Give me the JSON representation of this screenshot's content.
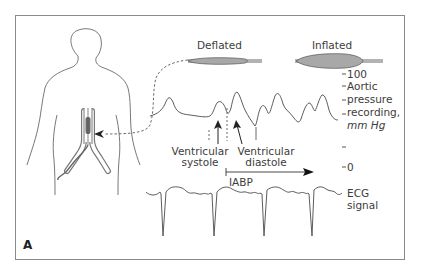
{
  "figure": {
    "panel_label": "A",
    "balloon": {
      "deflated_label": "Deflated",
      "inflated_label": "Inflated"
    },
    "pressure_axis": {
      "tick_top": "100",
      "tick_bottom": "0",
      "label_line1": "Aortic",
      "label_line2": "pressure",
      "label_line3": "recording,",
      "label_units": "mm Hg"
    },
    "annotations": {
      "systole_line1": "Ventricular",
      "systole_line2": "systole",
      "diastole_line1": "Ventricular",
      "diastole_line2": "diastole",
      "iabp": "IABP"
    },
    "ecg": {
      "label_line1": "ECG",
      "label_line2": "signal"
    },
    "colors": {
      "line": "#4a4a4a",
      "balloon_fill": "#a8a8a8",
      "catheter_fill": "#6a6a6a",
      "frame": "#8a8a8a"
    }
  }
}
